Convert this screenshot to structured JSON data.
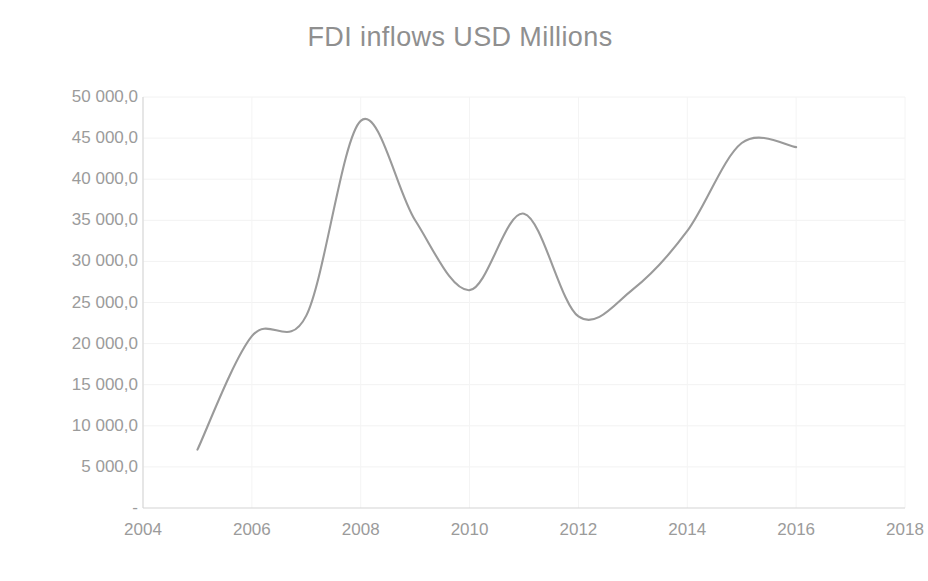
{
  "chart_data": {
    "type": "line",
    "title": "FDI inflows USD Millions",
    "xlabel": "",
    "ylabel": "",
    "grid": true,
    "legend": "none",
    "xlim": [
      2004,
      2018
    ],
    "ylim": [
      0,
      50000
    ],
    "x": [
      2005,
      2006,
      2007,
      2008,
      2009,
      2010,
      2011,
      2012,
      2013,
      2014,
      2015,
      2016
    ],
    "values": [
      7100,
      20900,
      23400,
      47100,
      35000,
      26500,
      35800,
      23300,
      26600,
      33700,
      44400,
      43900
    ],
    "series": [
      {
        "name": "FDI inflows USD Millions",
        "color": "#9a9a9a",
        "values": [
          7100,
          20900,
          23400,
          47100,
          35000,
          26500,
          35800,
          23300,
          26600,
          33700,
          44400,
          43900
        ]
      }
    ],
    "x_tick_labels": [
      "2004",
      "2006",
      "2008",
      "2010",
      "2012",
      "2014",
      "2016",
      "2018"
    ],
    "x_tick_values": [
      2004,
      2006,
      2008,
      2010,
      2012,
      2014,
      2016,
      2018
    ],
    "y_tick_labels": [
      "50 000,0",
      "45 000,0",
      "40 000,0",
      "35 000,0",
      "30 000,0",
      "25 000,0",
      "20 000,0",
      "15 000,0",
      "10 000,0",
      "5 000,0",
      "-"
    ],
    "y_tick_values": [
      50000,
      45000,
      40000,
      35000,
      30000,
      25000,
      20000,
      15000,
      10000,
      5000,
      0
    ]
  },
  "colors": {
    "line": "#9a9a9a",
    "axis": "#d6d6d6",
    "grid": "#eeeeee",
    "text": "#9b9b9b",
    "title": "#8f8f8f",
    "background": "#ffffff"
  }
}
